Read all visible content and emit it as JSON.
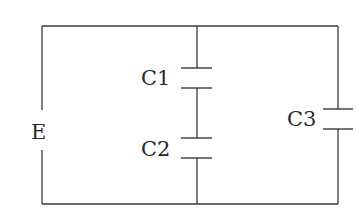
{
  "diagram": {
    "type": "circuit",
    "colors": {
      "wire": "#3a3a3a",
      "text": "#2a2a2a",
      "background": "#ffffff"
    },
    "source": {
      "label": "E"
    },
    "capacitors": [
      {
        "id": "C1",
        "label": "C1",
        "branch": "middle",
        "position": "upper"
      },
      {
        "id": "C2",
        "label": "C2",
        "branch": "middle",
        "position": "lower"
      },
      {
        "id": "C3",
        "label": "C3",
        "branch": "right"
      }
    ],
    "topology": "E in left branch; C1 and C2 in series in middle branch; C3 in right branch; all branches in parallel"
  }
}
